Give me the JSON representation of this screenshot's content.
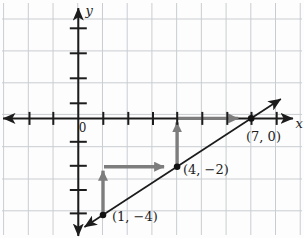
{
  "chart_data": {
    "type": "line",
    "title": "",
    "axes": {
      "x_label": "x",
      "y_label": "y",
      "origin_label": "0",
      "x_tick_values": [
        -2,
        -1,
        1,
        2,
        3,
        4,
        5,
        6,
        7,
        8
      ],
      "y_tick_values": [
        4,
        3,
        2,
        1,
        -1,
        -2,
        -3,
        -4
      ],
      "xlim": [
        -3.1,
        8.7
      ],
      "ylim": [
        -4.9,
        4.6
      ],
      "grid": true
    },
    "points": [
      {
        "x": 1,
        "y": -4,
        "label": "(1, −4)"
      },
      {
        "x": 4,
        "y": -2,
        "label": "(4, −2)"
      },
      {
        "x": 7,
        "y": 0,
        "label": "(7, 0)"
      }
    ],
    "line": {
      "through": [
        [
          1,
          -4
        ],
        [
          7,
          0
        ]
      ],
      "arrow_both_ends": true
    },
    "slope_arrows": [
      {
        "from": [
          1,
          -4
        ],
        "to": [
          1,
          -2
        ],
        "orientation": "vertical"
      },
      {
        "from": [
          1,
          -2
        ],
        "to": [
          4,
          -2
        ],
        "orientation": "horizontal"
      },
      {
        "from": [
          4,
          -2
        ],
        "to": [
          4,
          0
        ],
        "orientation": "vertical"
      },
      {
        "from": [
          4,
          0
        ],
        "to": [
          7,
          0
        ],
        "orientation": "horizontal"
      }
    ],
    "colors": {
      "axis": "#1c1c1c",
      "line": "#1c1c1c",
      "grid": "#c9cdd1",
      "slope_arrow": "#7d7d7d",
      "point": "#121212"
    }
  }
}
